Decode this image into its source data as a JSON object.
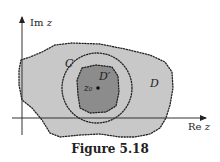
{
  "figure": {
    "caption": "Figure 5.18",
    "axes": {
      "x_label": "Re z",
      "y_label": "Im z"
    },
    "regions": [
      {
        "name": "D",
        "label": "D",
        "fill": "#c8c8c8",
        "boundary": "dotted"
      },
      {
        "name": "D-prime",
        "label": "D′",
        "fill": "#8c8c8c",
        "boundary": "dotted"
      }
    ],
    "circle": {
      "label": "C",
      "boundary": "dotted"
    },
    "point": {
      "label": "z₀"
    }
  },
  "colors": {
    "region_D": "#c8c8c8",
    "region_D_prime": "#8c8c8c",
    "ink": "#222222",
    "background": "#ffffff"
  }
}
